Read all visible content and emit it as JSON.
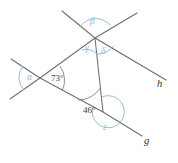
{
  "figure": {
    "type": "geometry-diagram",
    "background_color": "#ffffff",
    "line_color": "#6d6d6d",
    "arc_color_greek": "#8fb8d4",
    "arc_color_numeric": "#8a8a8a"
  },
  "lines": {
    "g_label": "g",
    "h_label": "h"
  },
  "angles": {
    "alpha": "α",
    "beta": "β",
    "gamma": "γ",
    "delta": "δ",
    "epsilon": "ε",
    "measure_73": "73°",
    "measure_46": "46°"
  }
}
